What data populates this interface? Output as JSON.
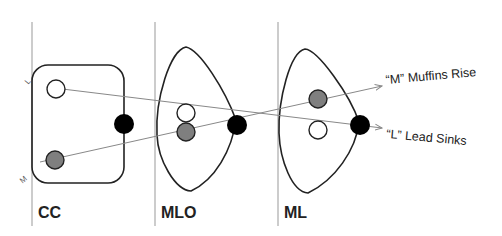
{
  "diagram": {
    "views": [
      {
        "id": "cc",
        "label": "CC"
      },
      {
        "id": "mlo",
        "label": "MLO"
      },
      {
        "id": "ml",
        "label": "ML"
      }
    ],
    "side_labels": {
      "top": "L",
      "bottom": "M"
    },
    "callouts": {
      "muffins": "“M” Muffins Rise",
      "lead": "“L” Lead Sinks"
    },
    "colors": {
      "outline": "#222222",
      "reference_line": "#888888",
      "lateral_lesion": "#ffffff",
      "medial_lesion": "#7f7f7f",
      "nipple": "#000000"
    }
  }
}
